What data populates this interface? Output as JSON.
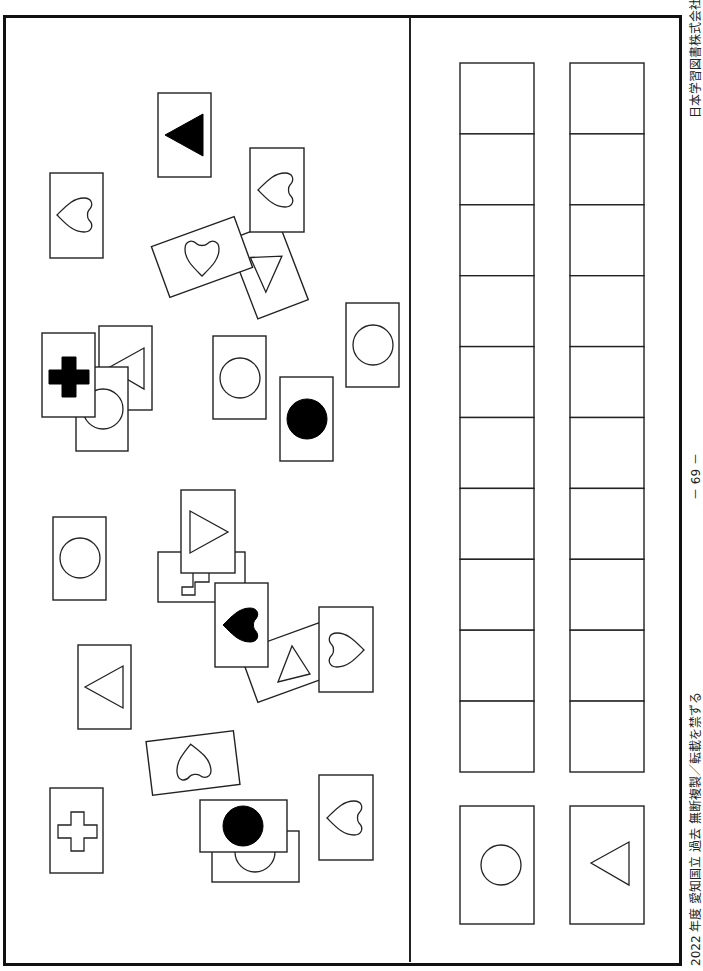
{
  "page": {
    "publisher": "日本学習図書株式会社",
    "page_number": "－ 69 －",
    "copyright": "2022 年度 愛知国立 過去 無断複製／転載を禁ずる"
  },
  "left_panel": {
    "description": "Scattered cards with symbols (some overlapping)",
    "cards": [
      {
        "symbol": "triangle-left",
        "fill": "filled"
      },
      {
        "symbol": "heart",
        "fill": "outline"
      },
      {
        "symbol": "heart",
        "fill": "outline"
      },
      {
        "symbol": "heart",
        "fill": "outline",
        "rotated": true
      },
      {
        "symbol": "triangle",
        "fill": "outline",
        "rotated": true,
        "partially_hidden": true
      },
      {
        "symbol": "triangle-left",
        "fill": "outline",
        "partially_hidden": true
      },
      {
        "symbol": "circle",
        "fill": "outline",
        "partially_hidden": true
      },
      {
        "symbol": "plus",
        "fill": "filled"
      },
      {
        "symbol": "circle",
        "fill": "outline"
      },
      {
        "symbol": "circle",
        "fill": "filled"
      },
      {
        "symbol": "circle",
        "fill": "outline"
      },
      {
        "symbol": "circle",
        "fill": "outline"
      },
      {
        "symbol": "plus",
        "fill": "outline",
        "partially_hidden": true
      },
      {
        "symbol": "triangle-right",
        "fill": "outline"
      },
      {
        "symbol": "heart",
        "fill": "filled"
      },
      {
        "symbol": "triangle",
        "fill": "outline",
        "rotated": true
      },
      {
        "symbol": "heart",
        "fill": "outline"
      },
      {
        "symbol": "triangle-left",
        "fill": "outline"
      },
      {
        "symbol": "heart",
        "fill": "outline",
        "rotated": true
      },
      {
        "symbol": "plus",
        "fill": "outline"
      },
      {
        "symbol": "circle",
        "fill": "outline",
        "partially_hidden": true
      },
      {
        "symbol": "circle",
        "fill": "filled"
      },
      {
        "symbol": "heart",
        "fill": "outline"
      }
    ]
  },
  "right_panel": {
    "answer_columns": [
      {
        "rows": 10,
        "key_card": {
          "symbol": "circle",
          "fill": "outline"
        }
      },
      {
        "rows": 10,
        "key_card": {
          "symbol": "triangle-left",
          "fill": "outline"
        }
      }
    ]
  }
}
